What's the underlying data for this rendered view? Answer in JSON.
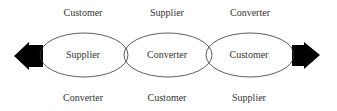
{
  "diagram": {
    "top_labels": [
      "Customer",
      "Supplier",
      "Converter"
    ],
    "center_labels": [
      "Supplier",
      "Converter",
      "Customer"
    ],
    "bottom_labels": [
      "Converter",
      "Customer",
      "Supplier"
    ],
    "arrows": {
      "left": "arrow-left",
      "right": "arrow-right"
    },
    "colors": {
      "stroke": "#333333",
      "arrow": "#000000",
      "text": "#333333"
    }
  }
}
